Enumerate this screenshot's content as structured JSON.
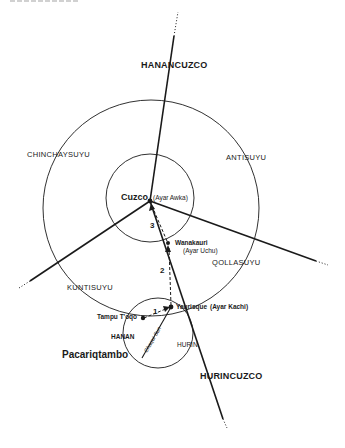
{
  "header": {
    "cutoff_title": "Genealogies"
  },
  "colors": {
    "ink": "#1a1a1a",
    "background": "#ffffff"
  },
  "axes": {
    "north": "HANANCUZCO",
    "south": "HURINCUZCO"
  },
  "suyus": {
    "chinchaysuyu": "CHINCHAYSUYU",
    "antisuyu": "ANTISUYU",
    "qollasuyu": "QOLLASUYU",
    "kuntisuyu": "KUNTISUYU"
  },
  "places": {
    "cuzco": {
      "name": "Cuzco",
      "ayar": "(Ayar Awka)"
    },
    "wanakauri": {
      "name": "Wanakauri",
      "ayar": "(Ayar Uchu)"
    },
    "yaurisque": {
      "name": "Yaurisque",
      "ayar": "(Ayar Kachi)"
    },
    "tampu_toqo": {
      "name": "Tampu T'oqo"
    },
    "pacariqtambo": {
      "name": "Pacariqtambo"
    }
  },
  "moieties": {
    "hanan": "HANAN",
    "hurin": "HURIN"
  },
  "route_labels": {
    "river": "Chaqui Sun"
  },
  "route_steps": [
    "1",
    "2",
    "3"
  ]
}
